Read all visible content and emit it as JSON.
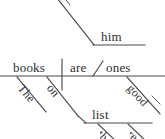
{
  "diagram": {
    "type": "reed-kellogg-sentence-diagram",
    "ink_color": "#4a4a4a",
    "text_color": "#2e2e2e",
    "background_color": "#ffffff",
    "upper_clause": {
      "object_word": "him",
      "note": "partial upper diagram; diagonal descends from off-screen top"
    },
    "main_clause": {
      "subject": "books",
      "verb": "are",
      "complement": "ones",
      "subject_modifier": "The",
      "preposition": "on",
      "complement_modifier": "good"
    },
    "prepositional_phrase": {
      "object": "list",
      "object_modifier_1": "the",
      "object_modifier_2": "re"
    }
  }
}
